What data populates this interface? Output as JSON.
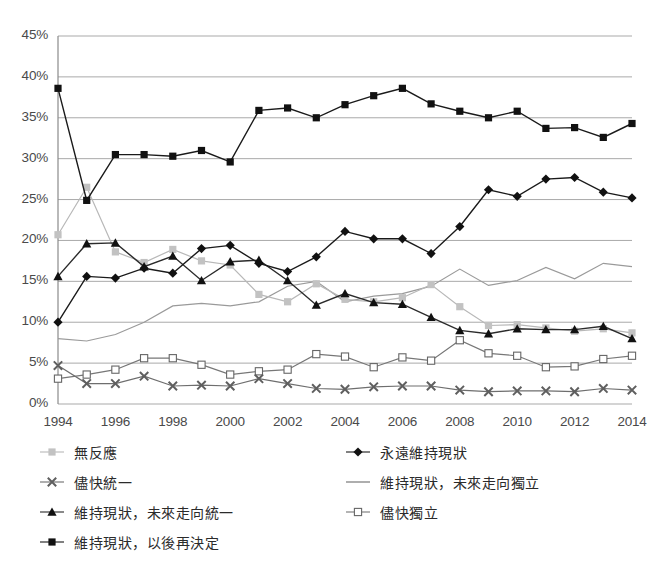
{
  "chart_data": {
    "type": "line",
    "title": "",
    "subtitle": "",
    "xlabel": "",
    "ylabel": "",
    "x": [
      1994,
      1995,
      1996,
      1997,
      1998,
      1999,
      2000,
      2001,
      2002,
      2003,
      2004,
      2005,
      2006,
      2007,
      2008,
      2009,
      2010,
      2011,
      2012,
      2013,
      2014
    ],
    "tick_x": [
      "1994",
      "1996",
      "1998",
      "2000",
      "2002",
      "2004",
      "2006",
      "2008",
      "2010",
      "2012",
      "2014"
    ],
    "tick_y": [
      "0%",
      "5%",
      "10%",
      "15%",
      "20%",
      "25%",
      "30%",
      "35%",
      "40%",
      "45%"
    ],
    "ylim": [
      0,
      45
    ],
    "xlim": [
      1994,
      2014
    ],
    "grid": true,
    "legend_position": "bottom",
    "series": [
      {
        "name": "無反應",
        "key": "no_response",
        "marker": "square-filled-gray",
        "color": "#b8b8b8",
        "values": [
          20.7,
          26.5,
          18.6,
          17.3,
          18.9,
          17.5,
          17.0,
          13.4,
          12.5,
          14.7,
          12.8,
          12.5,
          13.0,
          14.6,
          11.9,
          9.6,
          9.7,
          9.3,
          8.9,
          9.2,
          8.7
        ]
      },
      {
        "name": "儘快統一",
        "key": "unify_asap",
        "marker": "x-gray",
        "color": "#6e6e6e",
        "values": [
          4.7,
          2.5,
          2.5,
          3.4,
          2.2,
          2.3,
          2.2,
          3.1,
          2.5,
          1.9,
          1.8,
          2.1,
          2.2,
          2.2,
          1.7,
          1.5,
          1.6,
          1.6,
          1.5,
          1.9,
          1.7
        ]
      },
      {
        "name": "維持現狀，未來走向統一",
        "key": "status_quo_toward_unification",
        "marker": "triangle-filled",
        "color": "#2b2b2b",
        "values": [
          15.6,
          19.6,
          19.7,
          16.8,
          18.1,
          15.1,
          17.4,
          17.6,
          15.1,
          12.1,
          13.5,
          12.4,
          12.2,
          10.6,
          9.0,
          8.6,
          9.2,
          9.1,
          9.1,
          9.5,
          8.0
        ]
      },
      {
        "name": "維持現狀，以後再決定",
        "key": "status_quo_decide_later",
        "marker": "square-filled-black",
        "color": "#1a1a1a",
        "values": [
          38.6,
          24.9,
          30.5,
          30.5,
          30.3,
          31.0,
          29.6,
          35.9,
          36.2,
          35.0,
          36.6,
          37.7,
          38.6,
          36.7,
          35.8,
          35.0,
          35.8,
          33.7,
          33.8,
          32.6,
          34.3
        ]
      },
      {
        "name": "永遠維持現狀",
        "key": "status_quo_forever",
        "marker": "diamond-filled",
        "color": "#1a1a1a",
        "values": [
          10.0,
          15.6,
          15.4,
          16.6,
          16.0,
          19.0,
          19.4,
          17.2,
          16.2,
          18.0,
          21.1,
          20.2,
          20.2,
          18.4,
          21.7,
          26.2,
          25.4,
          27.5,
          27.7,
          25.9,
          25.2
        ]
      },
      {
        "name": "維持現狀，未來走向獨立",
        "key": "status_quo_toward_independence",
        "marker": "line-only",
        "color": "#9a9a9a",
        "values": [
          8.0,
          7.7,
          8.5,
          10.0,
          12.0,
          12.3,
          12.0,
          12.5,
          14.4,
          15.0,
          12.5,
          13.2,
          13.5,
          14.4,
          16.5,
          14.5,
          15.1,
          16.7,
          15.3,
          17.2,
          16.8
        ]
      },
      {
        "name": "儘快獨立",
        "key": "independence_asap",
        "marker": "square-open",
        "color": "#777777",
        "values": [
          3.1,
          3.6,
          4.2,
          5.6,
          5.6,
          4.8,
          3.6,
          4.0,
          4.2,
          6.1,
          5.8,
          4.5,
          5.7,
          5.3,
          7.8,
          6.2,
          5.9,
          4.5,
          4.6,
          5.5,
          5.9
        ]
      }
    ]
  },
  "legend": {
    "items": [
      {
        "label": "無反應",
        "marker": "square-filled-gray",
        "column": "a",
        "row": 0
      },
      {
        "label": "永遠維持現狀",
        "marker": "diamond-filled",
        "column": "b",
        "row": 0
      },
      {
        "label": "儘快統一",
        "marker": "x-gray",
        "column": "a",
        "row": 1
      },
      {
        "label": "維持現狀，未來走向獨立",
        "marker": "line-only",
        "column": "b",
        "row": 1
      },
      {
        "label": "維持現狀，未來走向統一",
        "marker": "triangle-filled",
        "column": "a",
        "row": 2
      },
      {
        "label": "儘快獨立",
        "marker": "square-open",
        "column": "b",
        "row": 2
      },
      {
        "label": "維持現狀，以後再決定",
        "marker": "square-filled-black",
        "column": "a",
        "row": 3
      }
    ]
  },
  "colors": {
    "grid": "#a9a9a9",
    "axis": "#8a8a8a",
    "text": "#4a4a4a",
    "background": "#ffffff"
  }
}
